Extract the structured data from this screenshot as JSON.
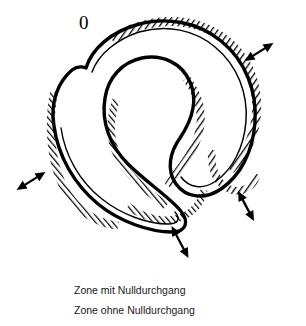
{
  "figure": {
    "zero_label": "0",
    "curve_description": "hand-drawn closed spiral curve with hatched zone bands",
    "colors": {
      "stroke": "#000000",
      "hatch": "#1a1a1a",
      "background": "#ffffff"
    },
    "arrows": [
      {
        "name": "arrow-top-right",
        "cx": 259,
        "cy": 52,
        "angle": -32,
        "length": 34
      },
      {
        "name": "arrow-left",
        "cx": 31,
        "cy": 181,
        "angle": -32,
        "length": 34
      },
      {
        "name": "arrow-bottom",
        "cx": 180,
        "cy": 242,
        "angle": 62,
        "length": 36
      },
      {
        "name": "arrow-right",
        "cx": 246,
        "cy": 206,
        "angle": 62,
        "length": 34
      }
    ]
  },
  "legend": {
    "items": [
      {
        "marker": "double-arrow",
        "marker_glyph": "↔",
        "label": "Zone mit Nulldurchgang"
      },
      {
        "marker": "zero",
        "marker_glyph": "0",
        "label": "Zone ohne Nulldurchgang"
      }
    ]
  }
}
